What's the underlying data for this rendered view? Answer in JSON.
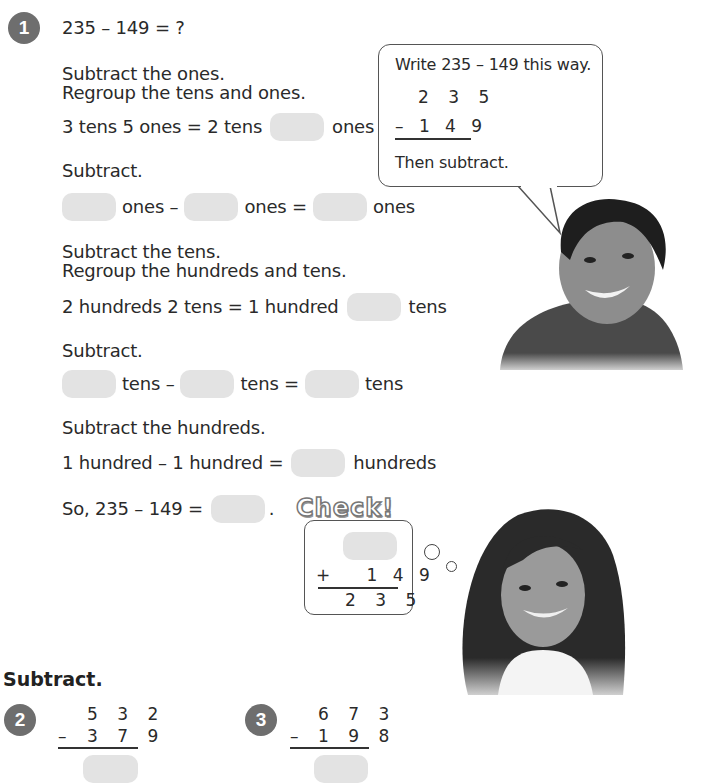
{
  "problem1": {
    "number": "1",
    "equation": "235 – 149 = ?",
    "step1_line1": "Subtract the ones.",
    "step1_line2": "Regroup the tens and ones.",
    "regroup_ones": {
      "left": "3 tens 5 ones = 2 tens",
      "right": "ones"
    },
    "subtract1": "Subtract.",
    "ones_row": {
      "a": "ones –",
      "b": "ones =",
      "c": "ones"
    },
    "step2_line1": "Subtract the tens.",
    "step2_line2": "Regroup the hundreds and tens.",
    "regroup_tens": {
      "left": "2 hundreds 2 tens = 1 hundred",
      "right": "tens"
    },
    "subtract2": "Subtract.",
    "tens_row": {
      "a": "tens –",
      "b": "tens =",
      "c": "tens"
    },
    "step3": "Subtract the hundreds.",
    "hundreds_row": {
      "left": "1 hundred – 1 hundred =",
      "right": "hundreds"
    },
    "conclusion": {
      "left": "So, 235 – 149 =",
      "right": "."
    }
  },
  "speech_bubble": {
    "line1": "Write 235 – 149 this way.",
    "top_number": "2 3 5",
    "bottom_number": "– 1 4 9",
    "line2": "Then subtract."
  },
  "check": {
    "title": "Check!",
    "addend": "+   1 4 9",
    "sum": "2 3 5"
  },
  "section_heading": "Subtract.",
  "problems": [
    {
      "number": "2",
      "top": "5 3 2",
      "operator": "–",
      "bottom": "3 7 9"
    },
    {
      "number": "3",
      "top": "6 7 3",
      "operator": "–",
      "bottom": "1 9 8"
    }
  ],
  "colors": {
    "badge": "#6e6e6e",
    "blank": "#e3e3e3",
    "text": "#2a2a2a"
  }
}
